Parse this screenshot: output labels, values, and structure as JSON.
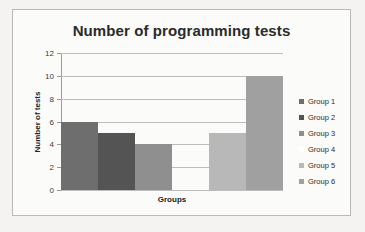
{
  "chart_data": {
    "type": "bar",
    "title": "Number of programming tests",
    "xlabel": "Groups",
    "ylabel": "Number of tests",
    "categories": [
      "Group 1",
      "Group 2",
      "Group 3",
      "Group 4",
      "Group 5",
      "Group 6"
    ],
    "values": [
      6,
      5,
      4,
      0,
      5,
      10
    ],
    "ylim": [
      0,
      12
    ],
    "yticks": [
      0,
      2,
      4,
      6,
      8,
      10,
      12
    ],
    "ytick_labels": [
      "0",
      "2",
      "4",
      "6",
      "8",
      "10",
      "12"
    ],
    "xtick_labels": [
      "",
      "",
      "",
      "",
      "",
      ""
    ],
    "grid": "horizontal",
    "legend_position": "right",
    "series_colors": [
      "#6e6e6e",
      "#545454",
      "#8f8f8f",
      "#ffffff",
      "#b8b8b8",
      "#a0a0a0"
    ],
    "legend": [
      {
        "label": "Group 1",
        "color": "#6e6e6e"
      },
      {
        "label": "Group 2",
        "color": "#545454"
      },
      {
        "label": "Group 3",
        "color": "#8f8f8f"
      },
      {
        "label": "Group 4",
        "color": "#ffffff"
      },
      {
        "label": "Group 5",
        "color": "#b8b8b8"
      },
      {
        "label": "Group 6",
        "color": "#a0a0a0"
      }
    ]
  },
  "style": {
    "background": "#f4f3f1",
    "plot_background": "#fbfbfa",
    "border_color": "#b9b9b9",
    "gridline_color": "#bdbdbd",
    "axis_color": "#9a9a9a",
    "title_color": "#2a2a2a",
    "text_color": "#2c2c2c"
  }
}
